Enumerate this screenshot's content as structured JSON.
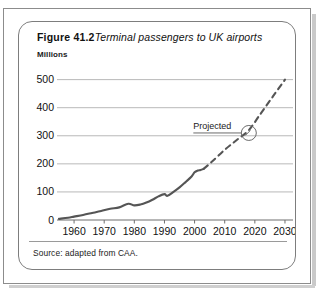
{
  "figure": {
    "label": "Figure 41.2",
    "caption": "Terminal passengers to UK airports",
    "units_label": "Millions",
    "source": "Source: adapted from CAA."
  },
  "annotation": {
    "projected_label": "Projected"
  },
  "colors": {
    "line": "#555555",
    "grid": "#b9b9b9",
    "axis": "#6f6f6f",
    "text": "#111111",
    "frame": "#7d7d7d"
  },
  "chart_data": {
    "type": "line",
    "title": "Terminal passengers to UK airports",
    "xlabel": "",
    "ylabel": "Millions",
    "xlim": [
      1955,
      2032
    ],
    "ylim": [
      0,
      520
    ],
    "yticks": [
      0,
      100,
      200,
      300,
      400,
      500
    ],
    "xticks": [
      1960,
      1970,
      1980,
      1990,
      2000,
      2010,
      2020,
      2030
    ],
    "grid": "horizontal",
    "legend": "none",
    "series": [
      {
        "name": "Actual",
        "style": "solid",
        "x": [
          1955,
          1958,
          1960,
          1963,
          1966,
          1969,
          1972,
          1975,
          1978,
          1980,
          1982,
          1984,
          1986,
          1988,
          1990,
          1991,
          1993,
          1995,
          1997,
          1999,
          2000,
          2001,
          2002,
          2003
        ],
        "values": [
          4,
          8,
          12,
          18,
          25,
          32,
          40,
          45,
          58,
          52,
          55,
          62,
          72,
          84,
          92,
          86,
          100,
          116,
          135,
          155,
          170,
          176,
          178,
          182
        ]
      },
      {
        "name": "Projected",
        "style": "dashed",
        "x": [
          2003,
          2006,
          2010,
          2014,
          2018,
          2022,
          2026,
          2030
        ],
        "values": [
          182,
          210,
          250,
          285,
          320,
          380,
          440,
          500
        ]
      }
    ],
    "annotations": [
      {
        "text": "Projected",
        "marker": "circle",
        "x": 2018,
        "y": 310
      }
    ]
  }
}
